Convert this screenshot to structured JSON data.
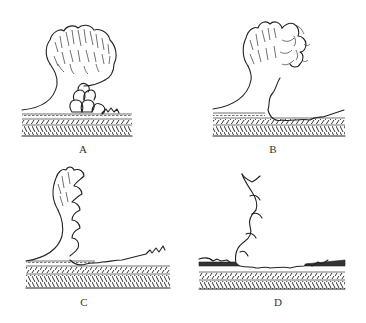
{
  "figure": {
    "panels": [
      {
        "id": "A",
        "label": "A",
        "stage": "dense branched head with cluster of rounded cells at base on layered substrate"
      },
      {
        "id": "B",
        "label": "B",
        "stage": "head partly replaced by netted cells, base spreading on substrate"
      },
      {
        "id": "C",
        "label": "C",
        "stage": "narrow branched head with scalloped cell margin, flattened base"
      },
      {
        "id": "D",
        "label": "D",
        "stage": "remnant scalloped strand on eroded substrate"
      }
    ]
  }
}
